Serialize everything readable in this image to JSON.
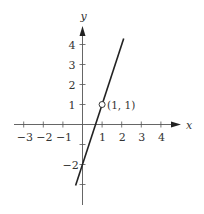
{
  "chart_data": {
    "type": "line",
    "title": "",
    "xlabel": "x",
    "ylabel": "y",
    "xlim": [
      -3.5,
      5
    ],
    "ylim": [
      -4,
      5
    ],
    "grid": false,
    "x_ticks": [
      -3,
      -2,
      -1,
      1,
      2,
      3,
      4
    ],
    "x_tick_labels": [
      "−3",
      "−2",
      "−1",
      "1",
      "2",
      "3",
      "4"
    ],
    "y_ticks": [
      -3,
      -2,
      -1,
      1,
      2,
      3,
      4
    ],
    "y_tick_labels": [
      "",
      "−2",
      "",
      "1",
      "2",
      "3",
      "4"
    ],
    "series": [
      {
        "name": "line",
        "equation": "y = 3x - 2",
        "x": [
          -0.35,
          2.1
        ],
        "y": [
          -3.05,
          4.3
        ],
        "color": "#222222"
      }
    ],
    "annotations": [
      {
        "type": "open-point",
        "x": 1,
        "y": 1,
        "label": "(1, 1)"
      }
    ]
  },
  "labels": {
    "x_axis": "x",
    "y_axis": "y",
    "point": "(1, 1)"
  }
}
